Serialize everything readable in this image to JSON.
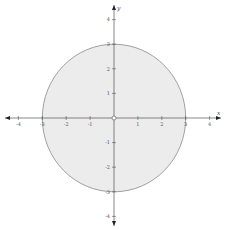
{
  "chart_data": {
    "type": "region-plot",
    "title": "",
    "xlabel": "x",
    "ylabel": "y",
    "xlim": [
      -4.3,
      4.3
    ],
    "ylim": [
      -4.3,
      4.3
    ],
    "grid": false,
    "x_ticks": [
      -4,
      -3,
      -2,
      -1,
      1,
      2,
      3,
      4
    ],
    "y_ticks": [
      -4,
      -3,
      -2,
      -1,
      1,
      2,
      3,
      4
    ],
    "x_tick_labels": [
      "-4",
      "-3",
      "-2",
      "-1",
      "1",
      "2",
      "3",
      "4"
    ],
    "y_tick_labels": [
      "-4",
      "-3",
      "-2",
      "-1",
      "1",
      "2",
      "3",
      "4"
    ],
    "shapes": [
      {
        "name": "disk",
        "kind": "circle",
        "center": [
          0,
          0
        ],
        "radius": 3,
        "fill": "#ececec",
        "stroke": "#8a8a8a",
        "description": "Shaded region 0 < x^2 + y^2 <= 9"
      },
      {
        "name": "excluded-origin",
        "kind": "open-point",
        "center": [
          0,
          0
        ],
        "fill": "#ffffff",
        "stroke": "#666666"
      }
    ],
    "colors": {
      "fill": "#ececec",
      "boundary": "#8a8a8a",
      "axis": "#555555",
      "arrow": "#222222"
    }
  }
}
